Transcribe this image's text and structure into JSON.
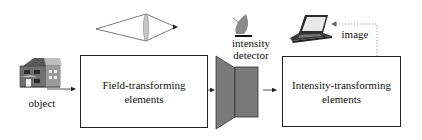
{
  "diagram": {
    "type": "imaging-system-block-diagram",
    "nodes": [
      {
        "id": "object",
        "label": "object",
        "icon": "house-icon"
      },
      {
        "id": "field",
        "label_line1": "Field-transforming",
        "label_line2": "elements",
        "icon_above": "lens-ray-diagram-icon"
      },
      {
        "id": "detector",
        "label_line1": "intensity",
        "label_line2": "detector",
        "icon": "satellite-dish-icon"
      },
      {
        "id": "intensity",
        "label_line1": "Intensity-transforming",
        "label_line2": "elements"
      },
      {
        "id": "image",
        "label": "image",
        "icon": "laptop-icon"
      }
    ],
    "edges": [
      {
        "from": "object",
        "to": "field",
        "style": "solid-arrow"
      },
      {
        "from": "field",
        "to": "detector",
        "style": "solid-arrow"
      },
      {
        "from": "detector",
        "to": "intensity",
        "style": "solid-arrow"
      },
      {
        "from": "intensity",
        "to": "image",
        "style": "dotted-arrow"
      }
    ],
    "colors": {
      "stroke": "#222222",
      "detector_fill": "#7a7a7a",
      "lens_fill": "#c8c8c8",
      "dotted": "#888888"
    }
  },
  "labels": {
    "object": "object",
    "field_line1": "Field-transforming",
    "field_line2": "elements",
    "detector_line1": "intensity",
    "detector_line2": "detector",
    "intensity_line1": "Intensity-transforming",
    "intensity_line2": "elements",
    "image": "image"
  }
}
